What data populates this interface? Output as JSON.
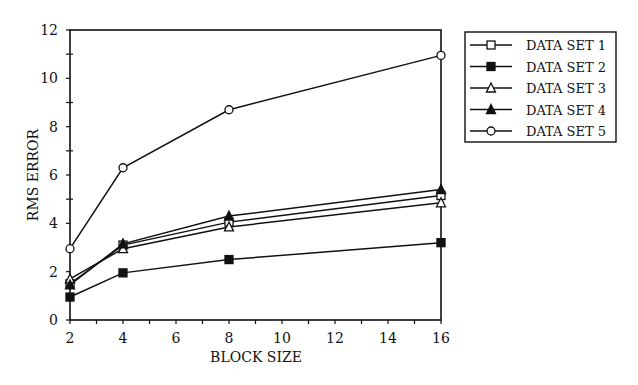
{
  "chart_data": {
    "type": "line",
    "title": "",
    "xlabel": "BLOCK SIZE",
    "ylabel": "RMS ERROR",
    "x": [
      2,
      4,
      8,
      16
    ],
    "xlim": [
      2,
      16
    ],
    "ylim": [
      0,
      12
    ],
    "xticks": [
      "2",
      "4",
      "6",
      "8",
      "10",
      "12",
      "14",
      "16"
    ],
    "yticks": [
      "0",
      "2",
      "4",
      "6",
      "8",
      "10",
      "12"
    ],
    "grid": false,
    "legend_position": "right",
    "series": [
      {
        "name": "DATA SET 1",
        "marker": "square-open",
        "values": [
          1.5,
          3.1,
          4.05,
          5.15
        ]
      },
      {
        "name": "DATA SET 2",
        "marker": "square-filled",
        "values": [
          0.95,
          1.95,
          2.5,
          3.2
        ]
      },
      {
        "name": "DATA SET 3",
        "marker": "triangle-open",
        "values": [
          1.7,
          2.95,
          3.85,
          4.85
        ]
      },
      {
        "name": "DATA SET 4",
        "marker": "triangle-filled",
        "values": [
          1.45,
          3.15,
          4.3,
          5.4
        ]
      },
      {
        "name": "DATA SET 5",
        "marker": "circle-open",
        "values": [
          2.95,
          6.3,
          8.7,
          10.95
        ]
      }
    ]
  },
  "colors": {
    "line": "#111111",
    "background": "#ffffff"
  }
}
